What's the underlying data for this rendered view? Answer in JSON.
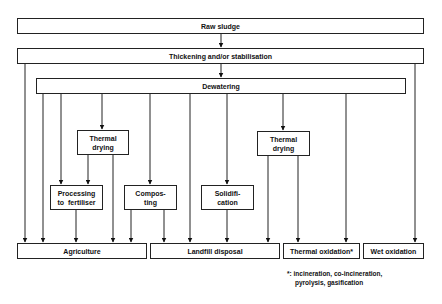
{
  "diagram": {
    "type": "flowchart",
    "nodes": {
      "raw_sludge": "Raw sludge",
      "thickening": "Thickening and/or stabilisation",
      "dewatering": "Dewatering",
      "thermal_drying_1_line1": "Thermal",
      "thermal_drying_1_line2": "drying",
      "processing_line1": "Processing",
      "processing_line2": "to  fertiliser",
      "composting_line1": "Compos-",
      "composting_line2": "ting",
      "solidification_line1": "Solidifi-",
      "solidification_line2": "cation",
      "thermal_drying_2_line1": "Thermal",
      "thermal_drying_2_line2": "drying",
      "agriculture": "Agriculture",
      "landfill": "Landfill disposal",
      "thermal_oxidation": "Thermal oxidation*",
      "wet_oxidation": "Wet oxidation"
    },
    "footnote": {
      "line1": "*: incineration, co-incineration,",
      "line2": "pyrolysis, gasification"
    },
    "edges": [
      [
        "Raw sludge",
        "Thickening and/or stabilisation"
      ],
      [
        "Thickening and/or stabilisation",
        "Dewatering"
      ],
      [
        "Thickening and/or stabilisation",
        "Agriculture"
      ],
      [
        "Thickening and/or stabilisation",
        "Wet oxidation"
      ],
      [
        "Dewatering",
        "Agriculture"
      ],
      [
        "Dewatering",
        "Processing to fertiliser"
      ],
      [
        "Dewatering",
        "Thermal drying"
      ],
      [
        "Dewatering",
        "Composting"
      ],
      [
        "Dewatering",
        "Landfill disposal"
      ],
      [
        "Dewatering",
        "Solidification"
      ],
      [
        "Dewatering",
        "Thermal drying (2)"
      ],
      [
        "Dewatering",
        "Thermal oxidation"
      ],
      [
        "Thermal drying",
        "Processing to fertiliser"
      ],
      [
        "Thermal drying",
        "Agriculture"
      ],
      [
        "Processing to fertiliser",
        "Agriculture"
      ],
      [
        "Composting",
        "Agriculture"
      ],
      [
        "Composting",
        "Landfill disposal"
      ],
      [
        "Solidification",
        "Landfill disposal"
      ],
      [
        "Thermal drying (2)",
        "Landfill disposal"
      ],
      [
        "Thermal drying (2)",
        "Thermal oxidation"
      ]
    ]
  }
}
